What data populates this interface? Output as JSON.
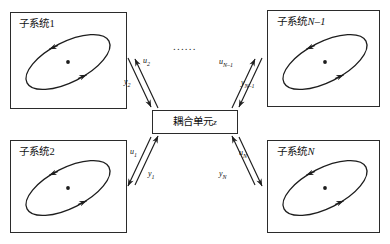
{
  "figure": {
    "type": "block-diagram",
    "ellipsis": "......"
  },
  "coupling_unit": {
    "label_cn": "耦合单元",
    "label_var": "z",
    "box": {
      "x": 152,
      "y": 110,
      "width": 86,
      "height": 24
    }
  },
  "subsystems": [
    {
      "id": "subsystem-1",
      "label_cn": "子系统",
      "label_index": "1",
      "label_italic": false,
      "position": "top-left",
      "box": {
        "x": 10,
        "y": 12,
        "width": 117,
        "height": 97
      },
      "label_pos": {
        "x": 19,
        "y": 19
      },
      "ellipse": {
        "cx": 68,
        "cy": 62,
        "rx": 46,
        "ry": 20,
        "rotate": -27
      }
    },
    {
      "id": "subsystem-n-minus-1",
      "label_cn": "子系统",
      "label_index": "N–1",
      "label_italic": true,
      "position": "top-right",
      "box": {
        "x": 267,
        "y": 10,
        "width": 113,
        "height": 97
      },
      "label_pos": {
        "x": 277,
        "y": 17
      },
      "ellipse": {
        "cx": 325,
        "cy": 62,
        "rx": 46,
        "ry": 20,
        "rotate": -27
      }
    },
    {
      "id": "subsystem-2",
      "label_cn": "子系统",
      "label_index": "2",
      "label_italic": false,
      "position": "bottom-left",
      "box": {
        "x": 10,
        "y": 140,
        "width": 117,
        "height": 93
      },
      "label_pos": {
        "x": 19,
        "y": 147
      },
      "ellipse": {
        "cx": 68,
        "cy": 188,
        "rx": 46,
        "ry": 20,
        "rotate": -27
      }
    },
    {
      "id": "subsystem-n",
      "label_cn": "子系统",
      "label_index": "N",
      "label_italic": true,
      "position": "bottom-right",
      "box": {
        "x": 267,
        "y": 140,
        "width": 113,
        "height": 93
      },
      "label_pos": {
        "x": 277,
        "y": 147
      },
      "ellipse": {
        "cx": 325,
        "cy": 188,
        "rx": 46,
        "ry": 20,
        "rotate": -27
      }
    }
  ],
  "signals": [
    {
      "id": "signal-u2",
      "symbol": "u",
      "subscript": "2",
      "direction": "coupling-to-subsystem-1",
      "label_pos": {
        "x": 143,
        "y": 57
      }
    },
    {
      "id": "signal-y2",
      "symbol": "y",
      "subscript": "2",
      "direction": "subsystem-1-to-coupling",
      "label_pos": {
        "x": 124,
        "y": 78
      }
    },
    {
      "id": "signal-un-1",
      "symbol": "u",
      "subscript": "N–1",
      "direction": "coupling-to-subsystem-n-minus-1",
      "label_pos": {
        "x": 219,
        "y": 58
      }
    },
    {
      "id": "signal-yn-1",
      "symbol": "y",
      "subscript": "N–1",
      "direction": "subsystem-n-minus-1-to-coupling",
      "label_pos": {
        "x": 241,
        "y": 79
      }
    },
    {
      "id": "signal-u1",
      "symbol": "u",
      "subscript": "1",
      "direction": "coupling-to-subsystem-2",
      "label_pos": {
        "x": 130,
        "y": 148
      }
    },
    {
      "id": "signal-y1",
      "symbol": "y",
      "subscript": "1",
      "direction": "subsystem-2-to-coupling",
      "label_pos": {
        "x": 148,
        "y": 170
      }
    },
    {
      "id": "signal-un",
      "symbol": "u",
      "subscript": "N",
      "direction": "coupling-to-subsystem-n",
      "label_pos": {
        "x": 239,
        "y": 149
      }
    },
    {
      "id": "signal-yn",
      "symbol": "y",
      "subscript": "N",
      "direction": "subsystem-n-to-coupling",
      "label_pos": {
        "x": 219,
        "y": 170
      }
    }
  ],
  "colors": {
    "stroke": "#2b2b2b",
    "text": "#111111",
    "background": "#ffffff"
  }
}
